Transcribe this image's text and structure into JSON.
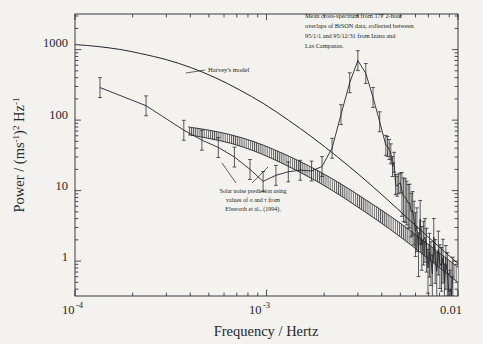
{
  "figure": {
    "background_color": "#f3f2ee",
    "ink_color": "#26262a",
    "frame": {
      "left": 75,
      "right": 458,
      "top": 14,
      "bottom": 296
    }
  },
  "axes": {
    "x": {
      "label": "Frequency / Hertz",
      "scale": "log",
      "min": 0.0001,
      "max": 0.01,
      "tick_labels": [
        {
          "value": 0.0001,
          "base": "10",
          "exp": "-4",
          "text": "10-4"
        },
        {
          "value": 0.001,
          "base": "10",
          "exp": "-3",
          "text": "10-3"
        },
        {
          "value": 0.01,
          "base": "0.01",
          "exp": "",
          "text": "0.01"
        }
      ]
    },
    "y": {
      "label_parts": {
        "p1": "Power / (ms",
        "e1": "-1",
        "p2": ")",
        "e2": "2",
        "p3": " Hz",
        "e3": "-1"
      },
      "label_plain": "Power / (ms-1)2 Hz-1",
      "scale": "log",
      "min": 0.32,
      "max": 3200,
      "tick_labels": [
        "1000",
        "100",
        "10",
        "1"
      ],
      "tick_values": [
        1000,
        100,
        10,
        1
      ]
    }
  },
  "annotations": {
    "top_right": {
      "name": "cross-spectrum-note",
      "lines": [
        "Mean cross-spectrum from 177 2-hour",
        "overlaps of BiSON data, collected between",
        "95/1/1 and 95/12/31 from Izana and",
        "Las Campanas."
      ]
    },
    "harvey": {
      "name": "harveys-model-label",
      "text": "Harvey's model"
    },
    "solar_noise": {
      "name": "solar-noise-note",
      "lines": [
        "Solar noise prediction using",
        "values of σ and  τ from",
        "Elsworth et al., (1994)."
      ]
    }
  },
  "chart_data": {
    "type": "line",
    "title": "",
    "xlabel": "Frequency / Hertz",
    "ylabel": "Power / (ms-1)2 Hz-1",
    "xscale": "log",
    "yscale": "log",
    "xlim": [
      0.0001,
      0.01
    ],
    "ylim": [
      0.32,
      3200
    ],
    "grid": false,
    "legend": "none",
    "series": [
      {
        "name": "Harvey's model",
        "style": "smooth-line",
        "x": [
          0.0001,
          0.00013,
          0.00017,
          0.00022,
          0.0003,
          0.0004,
          0.00054,
          0.00072,
          0.00097,
          0.0013,
          0.00175,
          0.00235,
          0.00315,
          0.0042,
          0.0056,
          0.0075,
          0.01
        ],
        "y": [
          1180,
          1110,
          1010,
          880,
          720,
          560,
          400,
          270,
          170,
          100,
          56,
          30,
          15.5,
          7.8,
          3.8,
          1.85,
          0.92
        ]
      },
      {
        "name": "BiSON mean cross-spectrum",
        "style": "points-with-errorbars",
        "x": [
          0.000135,
          0.000235,
          0.00037,
          0.00046,
          0.00056,
          0.00068,
          0.00082,
          0.00096,
          0.00112,
          0.0013,
          0.0015,
          0.00172,
          0.00195,
          0.0022,
          0.00245,
          0.00272,
          0.003,
          0.0033,
          0.0036,
          0.0039,
          0.0042,
          0.00455,
          0.0049,
          0.0053,
          0.0057,
          0.0061,
          0.0066,
          0.0071,
          0.0076,
          0.0082,
          0.0088,
          0.0094
        ],
        "y": [
          290,
          160,
          72,
          52,
          41,
          30,
          20,
          13.5,
          16.5,
          18.5,
          19.5,
          19.0,
          22,
          40,
          120,
          340,
          700,
          460,
          210,
          95,
          44,
          22,
          12.5,
          8.0,
          5.0,
          3.1,
          2.0,
          1.35,
          1.1,
          0.85,
          0.72,
          0.62
        ],
        "yerr_frac_low": 0.28,
        "yerr_frac_high": 0.38
      },
      {
        "name": "Solar noise prediction band (Elsworth et al. 1994)",
        "style": "hatched-band",
        "x": [
          0.00039,
          0.0005,
          0.00065,
          0.00085,
          0.0011,
          0.00145,
          0.0019,
          0.0025,
          0.0033,
          0.0044,
          0.0058,
          0.0076,
          0.01
        ],
        "y_upper": [
          80,
          72,
          62,
          50,
          38,
          27,
          18.5,
          12.0,
          7.4,
          4.4,
          2.55,
          1.45,
          0.82
        ],
        "y_lower": [
          62,
          55,
          47,
          37,
          27.5,
          19.0,
          12.8,
          8.1,
          4.9,
          2.85,
          1.62,
          0.9,
          0.5
        ]
      }
    ]
  },
  "background_bleed_text": [
    {
      "t": "as we are plotting the",
      "x": 6,
      "y": 92
    },
    {
      "t": "to study the region of",
      "x": 6,
      "y": 106
    },
    {
      "t": "ction used by the",
      "x": 6,
      "y": 120
    },
    {
      "t": "the 177 analysis of",
      "x": 6,
      "y": 134
    },
    {
      "t": "albeit with the graph",
      "x": 6,
      "y": 148
    },
    {
      "t": "now the BiSON data",
      "x": 6,
      "y": 162
    },
    {
      "t": "are indeed",
      "x": 6,
      "y": 176
    },
    {
      "t": "at lower",
      "x": 6,
      "y": 190
    },
    {
      "t": "with a",
      "x": 6,
      "y": 204
    },
    {
      "t": "amplitude",
      "x": 6,
      "y": 218
    },
    {
      "t": "indications that",
      "x": 6,
      "y": 232
    },
    {
      "t": "compared to",
      "x": 6,
      "y": 246
    },
    {
      "t": "be seen in the",
      "x": 6,
      "y": 260
    },
    {
      "t": "although there",
      "x": 6,
      "y": 274
    },
    {
      "t": "data becomes such a",
      "x": 6,
      "y": 300
    },
    {
      "t": "by the higher frequency and",
      "x": 6,
      "y": 318
    }
  ]
}
